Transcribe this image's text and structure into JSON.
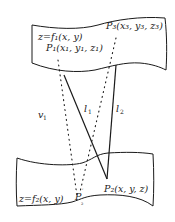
{
  "diagram": {
    "title": "",
    "colors": {
      "stroke": "#1a1a1a",
      "background": "#ffffff"
    },
    "surfaces": {
      "upper": {
        "equation": "z=f₁(x, y)"
      },
      "lower": {
        "equation": "z=f₂(x, y)"
      }
    },
    "points": {
      "p1": {
        "label": "P₁(x₁, y₁, z₁)"
      },
      "p3": {
        "label": "P₃(x₃, y₃, z₃)"
      },
      "p2": {
        "label": "P₂(x, y, z)"
      },
      "p2prime": {
        "label": "P",
        "prime": "′",
        "sub": "₂"
      }
    },
    "lines": {
      "l1": {
        "label": "l",
        "sub": "1"
      },
      "l2": {
        "label": "l",
        "sub": "2"
      },
      "v1": {
        "label": "v",
        "sub": "1"
      }
    }
  }
}
